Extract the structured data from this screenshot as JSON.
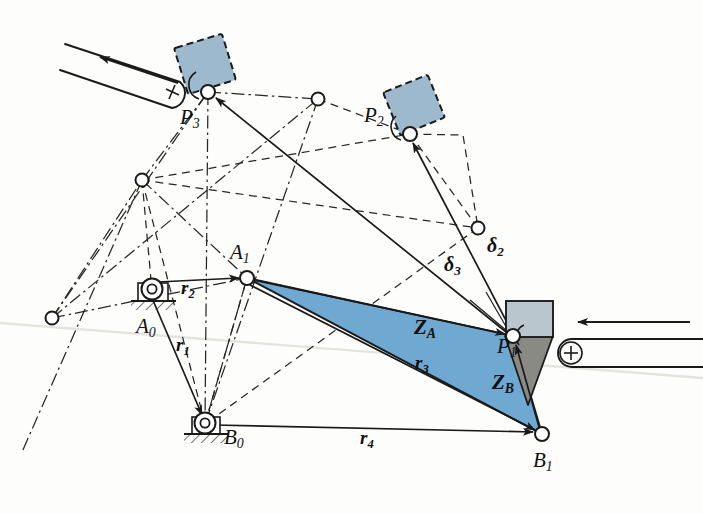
{
  "figure": {
    "type": "kinematic-synthesis-diagram",
    "background_color": "#fdfdfc",
    "ink_color": "#1a1a1a"
  },
  "colors": {
    "coupler_blue": "#6FA8D0",
    "coupler_blue_edge": "#1b1b1b",
    "wedge_gray": "#8A8A85",
    "slider_block_blue": "#9DB9CE",
    "slider_block_gray": "#B9C6CE",
    "ink": "#1a1a1a",
    "faint_scan_line": "#e2e2de"
  },
  "points": {
    "A0": {
      "label": "A",
      "sub": "0",
      "x": 152,
      "y": 291,
      "kind": "ground-pivot"
    },
    "B0": {
      "label": "B",
      "sub": "0",
      "x": 205,
      "y": 424,
      "kind": "ground-pivot"
    },
    "A1": {
      "label": "A",
      "sub": "1",
      "x": 247,
      "y": 278,
      "kind": "moving-pivot"
    },
    "B1": {
      "label": "B",
      "sub": "1",
      "x": 542,
      "y": 434,
      "kind": "moving-pivot"
    },
    "P1": {
      "label": "P",
      "sub": "1",
      "x": 513,
      "y": 336,
      "kind": "coupler-point"
    },
    "P2": {
      "label": "P",
      "sub": "2",
      "x": 410,
      "y": 134,
      "kind": "coupler-point"
    },
    "P3": {
      "label": "P",
      "sub": "3",
      "x": 208,
      "y": 92,
      "kind": "coupler-point"
    },
    "J_left": {
      "x": 52,
      "y": 318,
      "kind": "joint"
    },
    "J_mid_left": {
      "x": 142,
      "y": 180,
      "kind": "joint"
    },
    "J_top_right": {
      "x": 318,
      "y": 99,
      "kind": "joint"
    },
    "J_right": {
      "x": 478,
      "y": 228,
      "kind": "joint"
    }
  },
  "labels": {
    "A0": {
      "text": "A",
      "sub": "0",
      "x": 136,
      "y": 326
    },
    "B0": {
      "text": "B",
      "sub": "0",
      "x": 224,
      "y": 437
    },
    "A1": {
      "text": "A",
      "sub": "1",
      "x": 234,
      "y": 250
    },
    "B1": {
      "text": "B",
      "sub": "1",
      "x": 533,
      "y": 460
    },
    "P1": {
      "text": "P",
      "sub": "1",
      "x": 501,
      "y": 341
    },
    "P2": {
      "text": "P",
      "sub": "2",
      "x": 367,
      "y": 110
    },
    "P3": {
      "text": "P",
      "sub": "3",
      "x": 184,
      "y": 115
    },
    "r1": {
      "text": "r",
      "sub": "1",
      "x": 179,
      "y": 345
    },
    "r2": {
      "text": "r",
      "sub": "2",
      "x": 184,
      "y": 287
    },
    "r3": {
      "text": "r",
      "sub": "3",
      "x": 418,
      "y": 362
    },
    "r4": {
      "text": "r",
      "sub": "4",
      "x": 363,
      "y": 437
    },
    "ZA": {
      "text": "Z",
      "sub": "A",
      "x": 419,
      "y": 327
    },
    "ZB": {
      "text": "Z",
      "sub": "B",
      "x": 496,
      "y": 381
    },
    "d2": {
      "text": "δ",
      "sub": "2",
      "x": 490,
      "y": 246
    },
    "d3": {
      "text": "δ",
      "sub": "3",
      "x": 448,
      "y": 265
    },
    "plus_left": {
      "text": "+",
      "x": 172,
      "y": 90
    },
    "plus_right": {
      "text": "+",
      "x": 571,
      "y": 350
    }
  },
  "vectors": [
    {
      "name": "r1",
      "from": "A0",
      "to": "B0",
      "style": "solid",
      "arrow": "to"
    },
    {
      "name": "r2",
      "from": "A0",
      "to": "A1",
      "style": "solid",
      "arrow": "to"
    },
    {
      "name": "r3",
      "from": "A1",
      "to": "B1",
      "style": "solid",
      "arrow": "to"
    },
    {
      "name": "r4",
      "from": "B0",
      "to": "B1",
      "style": "solid",
      "arrow": "to"
    },
    {
      "name": "ZA",
      "from": "A1",
      "to": "P1",
      "style": "solid",
      "arrow": "to"
    },
    {
      "name": "ZB",
      "from": "B1",
      "to": "P1",
      "style": "solid",
      "arrow": "to"
    },
    {
      "name": "d2",
      "from": "P1",
      "to": "P2",
      "style": "solid",
      "arrow": "to"
    },
    {
      "name": "d3",
      "from": "P1",
      "to": "P3",
      "style": "solid",
      "arrow": "to"
    }
  ],
  "polygons": {
    "coupler_ZA": {
      "fill": "coupler_blue",
      "vertices": "A1,P1,B1"
    },
    "wedge_ZB": {
      "fill": "wedge_gray",
      "vertices": "P1-wedge"
    }
  },
  "sliders": [
    {
      "name": "slider-track-upper-left",
      "orientation": "inclined",
      "marker": "+",
      "arrow_direction": "up-left"
    },
    {
      "name": "slider-track-right",
      "orientation": "horizontal",
      "marker": "+",
      "arrow_direction": "left"
    }
  ],
  "blocks": [
    {
      "name": "block-P3",
      "at": "P3",
      "fill": "slider_block_blue",
      "edge": "dashed",
      "rotation": -18
    },
    {
      "name": "block-P2",
      "at": "P2",
      "fill": "slider_block_blue",
      "edge": "dashed",
      "rotation": -22
    },
    {
      "name": "block-P1",
      "at": "P1",
      "fill": "slider_block_gray",
      "edge": "solid",
      "rotation": 0
    }
  ],
  "line_styles": {
    "solid": "position vectors and links",
    "dashed": "construction lines for position 2",
    "dash_dot": "construction lines for position 3"
  }
}
